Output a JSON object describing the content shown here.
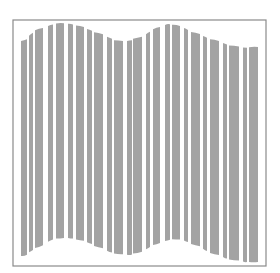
{
  "canvas": {
    "width": 280,
    "height": 273,
    "background": "#ffffff"
  },
  "frame": {
    "x": 13,
    "y": 20,
    "width": 253,
    "height": 246,
    "stroke": "#8a8a8a",
    "stroke_width": 1.2
  },
  "bar_color": "#a3a3a3",
  "wave": {
    "description": "Wavy vertical-stripe graphic: tops and bottoms follow a sine-like curve",
    "bars": [
      {
        "x": 21,
        "w": 6,
        "top": 41,
        "bottom": 256
      },
      {
        "x": 29,
        "w": 4,
        "top": 34,
        "bottom": 251
      },
      {
        "x": 35,
        "w": 8,
        "top": 29,
        "bottom": 247
      },
      {
        "x": 48,
        "w": 5,
        "top": 25,
        "bottom": 240
      },
      {
        "x": 56,
        "w": 8,
        "top": 23,
        "bottom": 238
      },
      {
        "x": 68,
        "w": 5,
        "top": 24,
        "bottom": 238
      },
      {
        "x": 76,
        "w": 8,
        "top": 26,
        "bottom": 240
      },
      {
        "x": 87,
        "w": 5,
        "top": 30,
        "bottom": 243
      },
      {
        "x": 94,
        "w": 9,
        "top": 33,
        "bottom": 247
      },
      {
        "x": 107,
        "w": 5,
        "top": 38,
        "bottom": 252
      },
      {
        "x": 114,
        "w": 9,
        "top": 41,
        "bottom": 254
      },
      {
        "x": 127,
        "w": 5,
        "top": 41,
        "bottom": 255
      },
      {
        "x": 133,
        "w": 9,
        "top": 38,
        "bottom": 253
      },
      {
        "x": 146,
        "w": 4,
        "top": 33,
        "bottom": 248
      },
      {
        "x": 153,
        "w": 7,
        "top": 28,
        "bottom": 244
      },
      {
        "x": 165,
        "w": 5,
        "top": 24,
        "bottom": 240
      },
      {
        "x": 172,
        "w": 8,
        "top": 25,
        "bottom": 239
      },
      {
        "x": 184,
        "w": 4,
        "top": 29,
        "bottom": 241
      },
      {
        "x": 191,
        "w": 9,
        "top": 33,
        "bottom": 245
      },
      {
        "x": 203,
        "w": 4,
        "top": 37,
        "bottom": 250
      },
      {
        "x": 210,
        "w": 9,
        "top": 40,
        "bottom": 254
      },
      {
        "x": 223,
        "w": 4,
        "top": 44,
        "bottom": 258
      },
      {
        "x": 229,
        "w": 10,
        "top": 46,
        "bottom": 260
      },
      {
        "x": 243,
        "w": 4,
        "top": 48,
        "bottom": 262
      },
      {
        "x": 249,
        "w": 9,
        "top": 47,
        "bottom": 262
      }
    ]
  }
}
